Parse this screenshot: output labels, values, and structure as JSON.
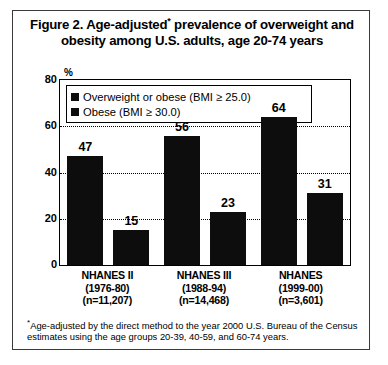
{
  "figure": {
    "title_part1": "Figure 2. Age-adjusted",
    "title_asterisk": "*",
    "title_part2": " prevalence of overweight and obesity among U.S. adults, age 20-74 years",
    "footnote_asterisk": "*",
    "footnote_text": "Age-adjusted by the direct method to the year 2000 U.S. Bureau of the Census estimates using the age groups  20-39, 40-59, and 60-74 years."
  },
  "chart_data": {
    "type": "bar",
    "title": "Figure 2. Age-adjusted* prevalence of overweight and obesity among U.S. adults, age 20-74 years",
    "xlabel": "",
    "ylabel": "%",
    "ylim": [
      0,
      80
    ],
    "yticks": [
      "0",
      "20",
      "40",
      "60",
      "80"
    ],
    "ytick_values": [
      0,
      20,
      40,
      60,
      80
    ],
    "gridlines": [
      20,
      40,
      60
    ],
    "grid": true,
    "legend_position": "top-left-inside",
    "categories": [
      "NHANES II",
      "NHANES III",
      "NHANES"
    ],
    "category_lines": [
      [
        "NHANES II",
        "(1976-80)",
        "(n=11,207)"
      ],
      [
        "NHANES III",
        "(1988-94)",
        "(n=14,468)"
      ],
      [
        "NHANES",
        "(1999-00)",
        "(n=3,601)"
      ]
    ],
    "series": [
      {
        "name": "Overweight or obese (BMI ≥ 25.0)",
        "color": "#0d0d0d",
        "values": [
          47,
          56,
          64
        ]
      },
      {
        "name": "Obese (BMI ≥ 30.0)",
        "color": "#0d0d0d",
        "values": [
          15,
          23,
          31
        ]
      }
    ]
  }
}
